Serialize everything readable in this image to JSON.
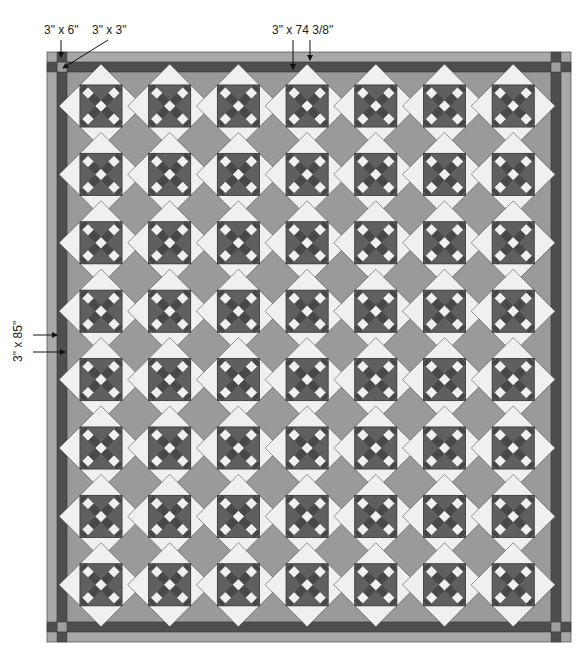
{
  "diagram": {
    "type": "quilt-layout",
    "labels": {
      "corner_strip": "3\" x 6\"",
      "corner_square": "3\" x 3\"",
      "top_border": "3\" x 74 3/8\"",
      "side_border": "3\" x 85\""
    },
    "grid": {
      "columns": 7,
      "rows": 8
    },
    "colors": {
      "background_field": "#9a9a9a",
      "outer_border": "#a8a8a8",
      "inner_border": "#4e4e4e",
      "corner_square": "#9f9f9f",
      "block_dark": "#5f5f5f",
      "block_darker": "#4a4a4a",
      "block_light": "#f0f0f0",
      "outline": "#333333"
    }
  }
}
